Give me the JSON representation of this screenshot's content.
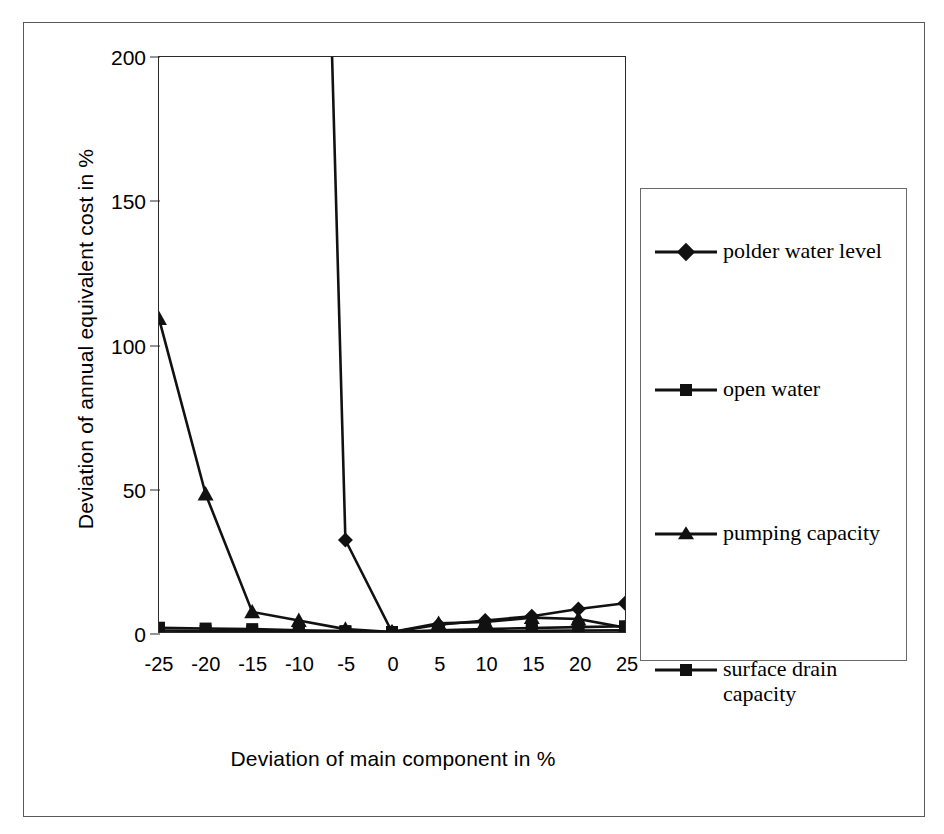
{
  "figure": {
    "background_color": "#ffffff",
    "frame_color": "#5a5a5a",
    "axis_color": "#2b2b2b",
    "series_color": "#111111"
  },
  "chart_data": {
    "type": "line",
    "title": "",
    "xlabel": "Deviation of main component in %",
    "ylabel": "Deviation of annual equivalent cost in %",
    "categories": [
      "-25",
      "-20",
      "-15",
      "-10",
      "-5",
      "0",
      "5",
      "10",
      "15",
      "20",
      "25"
    ],
    "x": [
      -25,
      -20,
      -15,
      -10,
      -5,
      0,
      5,
      10,
      15,
      20,
      25
    ],
    "xlim": [
      -25,
      25
    ],
    "ylim": [
      0,
      200
    ],
    "yticks": [
      0,
      50,
      100,
      150,
      200
    ],
    "xticks": [
      -25,
      -20,
      -15,
      -10,
      -5,
      0,
      5,
      10,
      15,
      20,
      25
    ],
    "grid": false,
    "legend_position": "right",
    "note": "polder water level series is clipped at the 200% top of the axis between x=-10 and x=-5",
    "series": [
      {
        "name": "polder water level",
        "marker": "diamond",
        "values": [
          null,
          null,
          null,
          620,
          32,
          0,
          2.5,
          4,
          5.5,
          8,
          10
        ],
        "clipped_above_axis": true
      },
      {
        "name": "open water",
        "marker": "square",
        "values": [
          1.5,
          1.2,
          1.0,
          0.6,
          0.3,
          0,
          0.6,
          1.0,
          1.4,
          1.7,
          2.0
        ]
      },
      {
        "name": "pumping capacity",
        "marker": "triangle",
        "values": [
          109,
          48,
          7,
          4,
          1,
          0,
          3,
          3.5,
          5,
          4.5,
          1.5
        ]
      },
      {
        "name": "surface drain capacity",
        "marker": "square",
        "values": [
          0.5,
          0.4,
          0.3,
          0.2,
          0.1,
          0,
          0.2,
          0.3,
          0.4,
          0.5,
          0.6
        ]
      }
    ]
  },
  "legend": {
    "items": [
      {
        "label": "polder water level",
        "marker": "diamond"
      },
      {
        "label": "open water",
        "marker": "square"
      },
      {
        "label": "pumping capacity",
        "marker": "triangle"
      },
      {
        "label": "surface drain capacity",
        "marker": "square"
      }
    ]
  },
  "caption": ""
}
